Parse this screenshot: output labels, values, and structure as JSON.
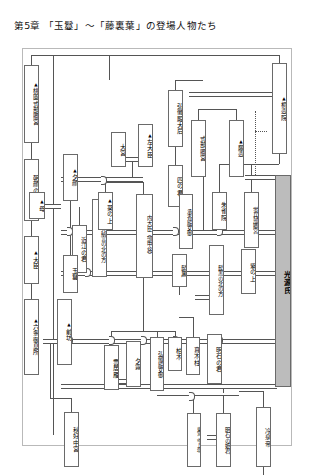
{
  "page": {
    "title": "第5章 「玉鬘」～「藤裏葉」の登場人物たち",
    "accent_gray": "#bcbcbc",
    "line_color": "#555555",
    "border_color": "#6a6a6a"
  },
  "legend": {
    "male_marker": "▲",
    "male_marker_meaning": "male-triangle-marker",
    "solid_double_line": "marriage-relationship",
    "dotted_line": "secret-relationship",
    "single_line": "parent-child-relationship"
  },
  "nodes": [
    {
      "id": "momozono",
      "label": "桃園式部卿宮",
      "male": true,
      "size": "normal"
    },
    {
      "id": "asagao",
      "label": "朝顔の姫君",
      "male": false,
      "size": "normal"
    },
    {
      "id": "daijin",
      "label": "大臣",
      "male": true,
      "size": "normal"
    },
    {
      "id": "rokujo",
      "label": "六条御息所",
      "male": true,
      "size": "normal"
    },
    {
      "id": "zenbo",
      "label": "前坊",
      "male": true,
      "size": "normal"
    },
    {
      "id": "akikonomu",
      "label": "秋好中宮",
      "male": false,
      "size": "normal"
    },
    {
      "id": "yugao",
      "label": "夕顔",
      "male": true,
      "size": "normal"
    },
    {
      "id": "haha",
      "label": "母",
      "male": true,
      "size": "normal"
    },
    {
      "id": "oumi",
      "label": "近江の君",
      "male": false,
      "size": "normal"
    },
    {
      "id": "azechi",
      "label": "按察大納言の北の方",
      "male": false,
      "size": "small"
    },
    {
      "id": "tamakazura",
      "label": "玉鬘",
      "male": false,
      "size": "normal"
    },
    {
      "id": "omiya",
      "label": "大宮",
      "male": false,
      "size": "normal"
    },
    {
      "id": "sadaijin",
      "label": "左大臣",
      "male": true,
      "size": "normal"
    },
    {
      "id": "naidaijin",
      "label": "内大臣（頭中将）",
      "male": false,
      "size": "small"
    },
    {
      "id": "shinokimi",
      "label": "四の君",
      "male": false,
      "size": "normal"
    },
    {
      "id": "aoi",
      "label": "葵の上",
      "male": true,
      "size": "normal"
    },
    {
      "id": "kumoi",
      "label": "雲居雁",
      "male": false,
      "size": "normal"
    },
    {
      "id": "yugiri",
      "label": "夕霧",
      "male": false,
      "size": "normal"
    },
    {
      "id": "kokiden_nyogo",
      "label": "弘徽殿女御",
      "male": false,
      "size": "small"
    },
    {
      "id": "kashiwagi",
      "label": "柏木",
      "male": false,
      "size": "normal"
    },
    {
      "id": "makibashira",
      "label": "真木柱",
      "male": false,
      "size": "normal"
    },
    {
      "id": "kokiden_taigo",
      "label": "弘徽殿大后",
      "male": false,
      "size": "normal"
    },
    {
      "id": "kiritsubo",
      "label": "桐壺院",
      "male": true,
      "size": "normal"
    },
    {
      "id": "shikibukyo",
      "label": "式部卿宮",
      "male": false,
      "size": "normal"
    },
    {
      "id": "fujitsubo",
      "label": "藤壺",
      "male": true,
      "size": "normal"
    },
    {
      "id": "suzaku",
      "label": "朱雀院",
      "male": false,
      "size": "normal"
    },
    {
      "id": "shokyoden",
      "label": "承香殿女御",
      "male": false,
      "size": "small"
    },
    {
      "id": "hotaru",
      "label": "蛍兵部卿宮",
      "male": false,
      "size": "small"
    },
    {
      "id": "hikaru",
      "label": "光源氏",
      "male": false,
      "size": "hero"
    },
    {
      "id": "murasaki",
      "label": "紫の上",
      "male": false,
      "size": "normal"
    },
    {
      "id": "higekuro",
      "label": "髭黒",
      "male": false,
      "size": "normal"
    },
    {
      "id": "higekuro_kita",
      "label": "髭黒の北の方",
      "male": false,
      "size": "small"
    },
    {
      "id": "akashi_kimi",
      "label": "明石の君",
      "male": false,
      "size": "normal"
    },
    {
      "id": "akashi_hime",
      "label": "明石の姫君",
      "male": false,
      "size": "small"
    },
    {
      "id": "togu",
      "label": "東宮（今上帝）",
      "male": false,
      "size": "tiny"
    },
    {
      "id": "reizei",
      "label": "冷泉帝",
      "male": false,
      "size": "normal"
    }
  ]
}
